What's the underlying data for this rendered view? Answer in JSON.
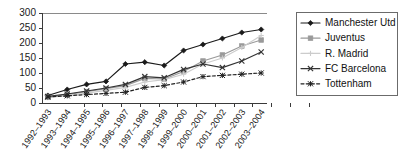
{
  "chart_data": {
    "type": "line",
    "title": "",
    "xlabel": "",
    "ylabel": "",
    "ylim": [
      0,
      300
    ],
    "ytick_values": [
      0,
      50,
      100,
      150,
      200,
      250,
      300
    ],
    "ytick_labels": [
      "0",
      "50",
      "100",
      "150",
      "200",
      "250",
      "300"
    ],
    "grid": false,
    "legend_position": "right",
    "categories": [
      "1992–1993",
      "1993–1994",
      "1994–1995",
      "1995–1996",
      "1996–1997",
      "1997–1998",
      "1998–1999",
      "1999–2000",
      "2000–2001",
      "2001–2002",
      "2002–2003",
      "2003–2004"
    ],
    "series": [
      {
        "name": "Manchester Utd",
        "color": "#1a1a1a",
        "marker": "diamond",
        "dash": "none",
        "values": [
          25,
          45,
          62,
          72,
          130,
          136,
          125,
          175,
          195,
          215,
          235,
          245
        ]
      },
      {
        "name": "Juventus",
        "color": "#9a9a9a",
        "marker": "square",
        "dash": "none",
        "values": [
          20,
          28,
          38,
          48,
          58,
          82,
          80,
          105,
          140,
          160,
          190,
          210
        ]
      },
      {
        "name": "R. Madrid",
        "color": "#cccccc",
        "marker": "plus",
        "dash": "none",
        "values": [
          18,
          25,
          33,
          42,
          52,
          70,
          78,
          96,
          130,
          150,
          185,
          225
        ]
      },
      {
        "name": "FC Barcelona",
        "color": "#333333",
        "marker": "x",
        "dash": "none",
        "values": [
          22,
          30,
          40,
          50,
          62,
          88,
          84,
          112,
          130,
          118,
          140,
          170
        ]
      },
      {
        "name": "Tottenham",
        "color": "#222222",
        "marker": "star",
        "dash": "dashed",
        "values": [
          20,
          24,
          28,
          32,
          36,
          52,
          58,
          70,
          88,
          92,
          96,
          100
        ]
      }
    ]
  },
  "legend": {
    "entries": [
      "Manchester Utd",
      "Juventus",
      "R. Madrid",
      "FC Barcelona",
      "Tottenham"
    ]
  }
}
